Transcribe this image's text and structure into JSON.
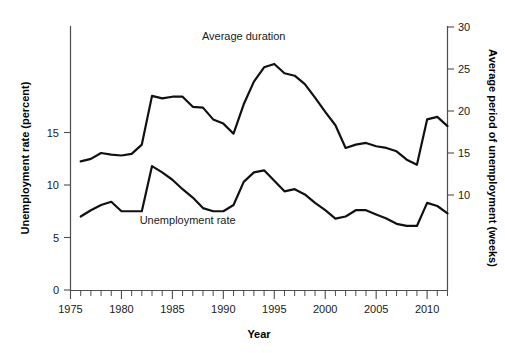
{
  "chart_data": {
    "type": "line",
    "title": "",
    "subtitle": "",
    "xlabel": "Year",
    "ylabel": "Unemployment rate (percent)",
    "y2label": "Average period of unemployment (weeks)",
    "grid": false,
    "legend_position": "inline-annotation",
    "xlim": [
      1975,
      2012
    ],
    "ylim": [
      0,
      17.5
    ],
    "y2lim": [
      0,
      30
    ],
    "xticks": [
      1975,
      1980,
      1985,
      1990,
      1995,
      2000,
      2005,
      2010
    ],
    "xtick_labels": [
      "1975",
      "1980",
      "1985",
      "1990",
      "1995",
      "2000",
      "2005",
      "2010"
    ],
    "xminor_tick_step": 1,
    "yticks": [
      0,
      5,
      10,
      15
    ],
    "ytick_labels": [
      "0",
      "5",
      "10",
      "15"
    ],
    "y2ticks": [
      10,
      15,
      20,
      25,
      30
    ],
    "y2tick_labels": [
      "10",
      "15",
      "20",
      "25",
      "30"
    ],
    "x": [
      1976,
      1977,
      1978,
      1979,
      1980,
      1981,
      1982,
      1983,
      1984,
      1985,
      1986,
      1987,
      1988,
      1989,
      1990,
      1991,
      1992,
      1993,
      1994,
      1995,
      1996,
      1997,
      1998,
      1999,
      2000,
      2001,
      2002,
      2003,
      2004,
      2005,
      2006,
      2007,
      2008,
      2009,
      2010,
      2011,
      2012
    ],
    "series": [
      {
        "name": "Average duration",
        "axis": "right",
        "units": "weeks",
        "label_x": 1992,
        "label_y": 28.5,
        "values": [
          14.0,
          14.3,
          15.0,
          14.8,
          14.7,
          14.9,
          16.0,
          21.8,
          21.5,
          21.7,
          21.7,
          20.5,
          20.4,
          19.0,
          18.5,
          17.3,
          20.8,
          23.5,
          25.2,
          25.6,
          24.5,
          24.2,
          23.2,
          21.6,
          19.9,
          18.3,
          15.6,
          16.0,
          16.2,
          15.8,
          15.6,
          15.2,
          14.2,
          13.6,
          19.0,
          19.3,
          18.2
        ]
      },
      {
        "name": "Unemployment rate",
        "axis": "left",
        "units": "percent",
        "label_x": 1986.5,
        "label_y": 6.3,
        "values": [
          7.0,
          7.6,
          8.1,
          8.4,
          7.5,
          7.5,
          7.5,
          11.8,
          11.2,
          10.5,
          9.6,
          8.8,
          7.8,
          7.5,
          7.5,
          8.1,
          10.3,
          11.2,
          11.4,
          10.4,
          9.4,
          9.6,
          9.1,
          8.3,
          7.6,
          6.8,
          7.0,
          7.6,
          7.6,
          7.2,
          6.8,
          6.3,
          6.1,
          6.1,
          8.3,
          8.0,
          7.3
        ]
      }
    ]
  },
  "axes": {
    "left_title": "Unemployment rate (percent)",
    "right_title": "Average period of unemployment (weeks)",
    "bottom_title": "Year"
  },
  "annotations": {
    "duration_label": "Average duration",
    "rate_label": "Unemployment rate"
  }
}
